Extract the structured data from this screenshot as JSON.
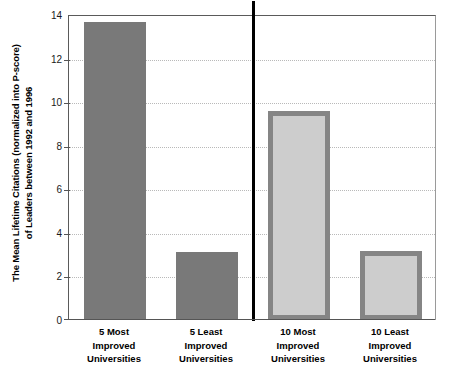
{
  "chart_data": {
    "type": "bar",
    "title": "",
    "xlabel": "",
    "ylabel": "The Mean Lifetime Citations (normalized into P-score) of Leaders between 1992 and 1996",
    "ylabel_lines": [
      "The Mean Lifetime Citations (normalized into P-score)",
      "of Leaders between 1992 and 1996"
    ],
    "categories": [
      "5 Most Improved Universities",
      "5 Least Improved Universities",
      "10 Most Improved Universities",
      "10 Least Improved Universities"
    ],
    "category_lines": [
      [
        "5 Most",
        "Improved",
        "Universities"
      ],
      [
        "5 Least",
        "Improved",
        "Universities"
      ],
      [
        "10 Most",
        "Improved",
        "Universities"
      ],
      [
        "10 Least",
        "Improved",
        "Universities"
      ]
    ],
    "values": [
      13.7,
      3.1,
      9.6,
      3.15
    ],
    "bar_styles": [
      "dark",
      "dark",
      "light",
      "light"
    ],
    "ylim": [
      0,
      14
    ],
    "yticks": [
      0,
      2,
      4,
      6,
      8,
      10,
      12,
      14
    ],
    "ytick_labels": [
      "0",
      "2",
      "4",
      "6",
      "8",
      "10",
      "12",
      "14"
    ],
    "grid": true,
    "legend": false,
    "group_divider_after_category": 2,
    "colors": {
      "dark_bar_fill": "#797979",
      "light_bar_fill": "#cdcdcd",
      "light_bar_border": "#858585",
      "gridline": "#b9b9b9",
      "axis": "#555555",
      "divider": "#000000",
      "text": "#000000",
      "background": "#ffffff"
    }
  }
}
